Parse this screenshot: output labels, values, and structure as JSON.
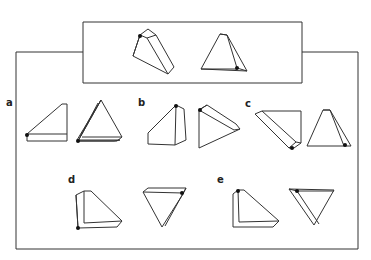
{
  "figure": {
    "type": "mental-rotation-puzzle",
    "example": {
      "description": "Two views of the same triangular wedge prism with a black dot marking one vertex",
      "shapes": [
        "example-shape-1",
        "example-shape-2"
      ]
    },
    "options": [
      {
        "label": "a",
        "shapes": [
          "option-a-shape-1",
          "option-a-shape-2"
        ]
      },
      {
        "label": "b",
        "shapes": [
          "option-b-shape-1",
          "option-b-shape-2"
        ]
      },
      {
        "label": "c",
        "shapes": [
          "option-c-shape-1",
          "option-c-shape-2"
        ]
      },
      {
        "label": "d",
        "shapes": [
          "option-d-shape-1",
          "option-d-shape-2"
        ]
      },
      {
        "label": "e",
        "shapes": [
          "option-e-shape-1",
          "option-e-shape-2"
        ]
      }
    ],
    "colors": {
      "line": "#333333",
      "dot": "#111111",
      "background": "#ffffff"
    }
  }
}
